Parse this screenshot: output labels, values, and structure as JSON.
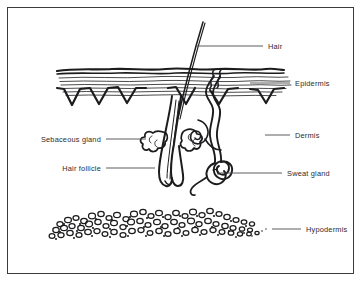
{
  "diagram": {
    "type": "anatomical-line-drawing",
    "background_color": "#ffffff",
    "ink_color": "#1c1c1e",
    "border_color": "#3b3b3f",
    "label_color": "#2b2b2e",
    "labels": [
      {
        "id": "hair",
        "text": "Hair",
        "side": "right",
        "text_x": 268,
        "text_y": 45,
        "leader": {
          "x1": 196,
          "y1": 46,
          "x2": 263,
          "y2": 46
        }
      },
      {
        "id": "epidermis",
        "text": "Epidermis",
        "side": "right",
        "text_x": 295,
        "text_y": 85,
        "leader": {
          "x1": 250,
          "y1": 83,
          "x2": 290,
          "y2": 83
        }
      },
      {
        "id": "dermis",
        "text": "Dermis",
        "side": "right",
        "text_x": 295,
        "text_y": 137,
        "leader": {
          "x1": 265,
          "y1": 135,
          "x2": 290,
          "y2": 135
        }
      },
      {
        "id": "sweat-gland",
        "text": "Sweat gland",
        "side": "right",
        "text_x": 287,
        "text_y": 175,
        "leader": {
          "x1": 218,
          "y1": 173,
          "x2": 282,
          "y2": 173
        }
      },
      {
        "id": "hypodermis",
        "text": "Hypodermis",
        "side": "right",
        "text_x": 306,
        "text_y": 231,
        "leader": {
          "x1": 272,
          "y1": 229,
          "x2": 301,
          "y2": 229
        }
      },
      {
        "id": "sebaceous-gland",
        "text": "Sebaceous gland",
        "side": "left",
        "text_x": 30,
        "text_y": 140,
        "leader": {
          "x1": 106,
          "y1": 139,
          "x2": 146,
          "y2": 139
        }
      },
      {
        "id": "hair-follicle",
        "text": "Hair follicle",
        "side": "left",
        "text_x": 57,
        "text_y": 170,
        "leader": {
          "x1": 106,
          "y1": 168,
          "x2": 155,
          "y2": 168
        }
      }
    ],
    "structures": [
      {
        "id": "hair-shaft",
        "name": "Hair shaft"
      },
      {
        "id": "epidermis-layer",
        "name": "Epidermis layer with rete ridges"
      },
      {
        "id": "dermis-layer",
        "name": "Dermis layer"
      },
      {
        "id": "hair-follicle-tube",
        "name": "Hair follicle tube with bulb"
      },
      {
        "id": "sebaceous-gland-lobes",
        "name": "Sebaceous gland lobes"
      },
      {
        "id": "sweat-gland-duct",
        "name": "Sweat gland duct and coil"
      },
      {
        "id": "hypodermis-fat",
        "name": "Hypodermis adipose tissue"
      }
    ]
  }
}
